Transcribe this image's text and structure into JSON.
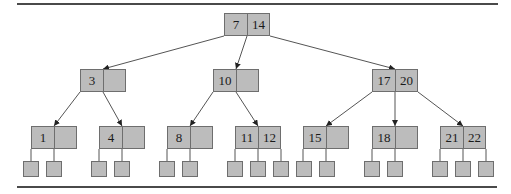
{
  "diagram": {
    "type": "b-tree",
    "colors": {
      "node_fill": "#bcbcbc",
      "node_border": "#6e6e6e",
      "edge": "#555555",
      "rule": "#4a4a4a"
    },
    "rules": [
      {
        "name": "top-rule",
        "x1": 17,
        "x2": 498,
        "y": 3
      },
      {
        "name": "bottom-rule",
        "x1": 17,
        "x2": 497,
        "y": 186
      }
    ],
    "nodes": [
      {
        "id": "root",
        "keys": [
          "7",
          "14"
        ],
        "x": 224,
        "y": 13,
        "w": 46
      },
      {
        "id": "n3",
        "keys": [
          "3",
          ""
        ],
        "x": 80,
        "y": 69,
        "w": 46
      },
      {
        "id": "n10",
        "keys": [
          "10",
          ""
        ],
        "x": 213,
        "y": 69,
        "w": 46
      },
      {
        "id": "n17",
        "keys": [
          "17",
          "20"
        ],
        "x": 372,
        "y": 69,
        "w": 46
      },
      {
        "id": "n1",
        "keys": [
          "1",
          ""
        ],
        "x": 31,
        "y": 126,
        "w": 46
      },
      {
        "id": "n4",
        "keys": [
          "4",
          ""
        ],
        "x": 99,
        "y": 126,
        "w": 46
      },
      {
        "id": "n8",
        "keys": [
          "8",
          ""
        ],
        "x": 167,
        "y": 126,
        "w": 46
      },
      {
        "id": "n11",
        "keys": [
          "11",
          "12"
        ],
        "x": 235,
        "y": 126,
        "w": 46
      },
      {
        "id": "n15",
        "keys": [
          "15",
          ""
        ],
        "x": 303,
        "y": 126,
        "w": 46
      },
      {
        "id": "n18",
        "keys": [
          "18",
          ""
        ],
        "x": 372,
        "y": 126,
        "w": 46
      },
      {
        "id": "n21",
        "keys": [
          "21",
          "22"
        ],
        "x": 440,
        "y": 126,
        "w": 46
      }
    ],
    "leaves": [
      {
        "parent": "n1",
        "x": 23,
        "y": 161
      },
      {
        "parent": "n1",
        "x": 46,
        "y": 161
      },
      {
        "parent": "n4",
        "x": 91,
        "y": 161
      },
      {
        "parent": "n4",
        "x": 114,
        "y": 161
      },
      {
        "parent": "n8",
        "x": 159,
        "y": 161
      },
      {
        "parent": "n8",
        "x": 182,
        "y": 161
      },
      {
        "parent": "n11",
        "x": 227,
        "y": 161
      },
      {
        "parent": "n11",
        "x": 250,
        "y": 161
      },
      {
        "parent": "n11",
        "x": 273,
        "y": 161
      },
      {
        "parent": "n15",
        "x": 296,
        "y": 161
      },
      {
        "parent": "n15",
        "x": 319,
        "y": 161
      },
      {
        "parent": "n18",
        "x": 364,
        "y": 161
      },
      {
        "parent": "n18",
        "x": 387,
        "y": 161
      },
      {
        "parent": "n21",
        "x": 432,
        "y": 161
      },
      {
        "parent": "n21",
        "x": 455,
        "y": 161
      },
      {
        "parent": "n21",
        "x": 478,
        "y": 161
      }
    ],
    "edges": [
      {
        "from": "root",
        "to": "n3",
        "x1": 224,
        "y1": 36,
        "x2": 103,
        "y2": 69,
        "arrow": true
      },
      {
        "from": "root",
        "to": "n10",
        "x1": 247,
        "y1": 36,
        "x2": 236,
        "y2": 69,
        "arrow": true
      },
      {
        "from": "root",
        "to": "n17",
        "x1": 270,
        "y1": 36,
        "x2": 395,
        "y2": 69,
        "arrow": true
      },
      {
        "from": "n3",
        "to": "n1",
        "x1": 80,
        "y1": 92,
        "x2": 54,
        "y2": 126,
        "arrow": true
      },
      {
        "from": "n3",
        "to": "n4",
        "x1": 103,
        "y1": 92,
        "x2": 122,
        "y2": 126,
        "arrow": true
      },
      {
        "from": "n10",
        "to": "n8",
        "x1": 213,
        "y1": 92,
        "x2": 190,
        "y2": 126,
        "arrow": true
      },
      {
        "from": "n10",
        "to": "n11",
        "x1": 236,
        "y1": 92,
        "x2": 258,
        "y2": 126,
        "arrow": true
      },
      {
        "from": "n17",
        "to": "n15",
        "x1": 372,
        "y1": 92,
        "x2": 326,
        "y2": 126,
        "arrow": true
      },
      {
        "from": "n17",
        "to": "n18",
        "x1": 395,
        "y1": 92,
        "x2": 395,
        "y2": 126,
        "arrow": true
      },
      {
        "from": "n17",
        "to": "n21",
        "x1": 418,
        "y1": 92,
        "x2": 463,
        "y2": 126,
        "arrow": true
      },
      {
        "from": "n1",
        "to": "leaf",
        "x1": 31,
        "y1": 149,
        "x2": 31,
        "y2": 161,
        "arrow": false
      },
      {
        "from": "n1",
        "to": "leaf",
        "x1": 54,
        "y1": 149,
        "x2": 54,
        "y2": 161,
        "arrow": false
      },
      {
        "from": "n4",
        "to": "leaf",
        "x1": 99,
        "y1": 149,
        "x2": 99,
        "y2": 161,
        "arrow": false
      },
      {
        "from": "n4",
        "to": "leaf",
        "x1": 122,
        "y1": 149,
        "x2": 122,
        "y2": 161,
        "arrow": false
      },
      {
        "from": "n8",
        "to": "leaf",
        "x1": 167,
        "y1": 149,
        "x2": 167,
        "y2": 161,
        "arrow": false
      },
      {
        "from": "n8",
        "to": "leaf",
        "x1": 190,
        "y1": 149,
        "x2": 190,
        "y2": 161,
        "arrow": false
      },
      {
        "from": "n11",
        "to": "leaf",
        "x1": 235,
        "y1": 149,
        "x2": 235,
        "y2": 161,
        "arrow": false
      },
      {
        "from": "n11",
        "to": "leaf",
        "x1": 258,
        "y1": 149,
        "x2": 258,
        "y2": 161,
        "arrow": false
      },
      {
        "from": "n11",
        "to": "leaf",
        "x1": 281,
        "y1": 149,
        "x2": 281,
        "y2": 161,
        "arrow": false
      },
      {
        "from": "n15",
        "to": "leaf",
        "x1": 303,
        "y1": 149,
        "x2": 303,
        "y2": 161,
        "arrow": false
      },
      {
        "from": "n15",
        "to": "leaf",
        "x1": 326,
        "y1": 149,
        "x2": 326,
        "y2": 161,
        "arrow": false
      },
      {
        "from": "n18",
        "to": "leaf",
        "x1": 372,
        "y1": 149,
        "x2": 372,
        "y2": 161,
        "arrow": false
      },
      {
        "from": "n18",
        "to": "leaf",
        "x1": 395,
        "y1": 149,
        "x2": 395,
        "y2": 161,
        "arrow": false
      },
      {
        "from": "n21",
        "to": "leaf",
        "x1": 440,
        "y1": 149,
        "x2": 440,
        "y2": 161,
        "arrow": false
      },
      {
        "from": "n21",
        "to": "leaf",
        "x1": 463,
        "y1": 149,
        "x2": 463,
        "y2": 161,
        "arrow": false
      },
      {
        "from": "n21",
        "to": "leaf",
        "x1": 486,
        "y1": 149,
        "x2": 486,
        "y2": 161,
        "arrow": false
      }
    ]
  }
}
